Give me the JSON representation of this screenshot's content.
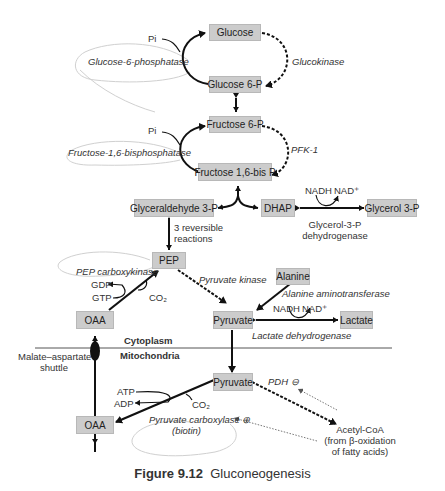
{
  "figure": {
    "caption_number": "Figure 9.12",
    "caption_title": "Gluconeogenesis"
  },
  "metabolites": {
    "glucose": "Glucose",
    "glucose6p": "Glucose 6-P",
    "fructose6p": "Fructose 6-P",
    "fructose16bp": "Fructose 1,6-bis P",
    "gap": "Glyceraldehyde 3-P",
    "dhap": "DHAP",
    "glycerol3p": "Glycerol 3-P",
    "pep": "PEP",
    "alanine": "Alanine",
    "pyruvate_cyto": "Pyruvate",
    "lactate": "Lactate",
    "oaa_cyto": "OAA",
    "pyruvate_mito": "Pyruvate",
    "oaa_mito": "OAA"
  },
  "enzymes": {
    "g6pase": "Glucose-6-phosphatase",
    "glucokinase": "Glucokinase",
    "f16bpase": "Fructose-1,6-bisphosphatase",
    "pfk1": "PFK-1",
    "g3pdh_line1": "Glycerol-3-P",
    "g3pdh_line2": "dehydrogenase",
    "pepck": "PEP carboxykinase",
    "pyruvate_kinase": "Pyruvate kinase",
    "alt": "Alanine aminotransferase",
    "ldh": "Lactate dehydrogenase",
    "pdh": "PDH ⊖",
    "pc_line1": "Pyruvate carboxylase ⊕",
    "pc_line2": "(biotin)"
  },
  "cofactors": {
    "pi_1": "Pi",
    "pi_2": "Pi",
    "nadh_1": "NADH",
    "nad_1": "NAD⁺",
    "nadh_2": "NADH",
    "nad_2": "NAD⁺",
    "gdp": "GDP",
    "gtp": "GTP",
    "co2_1": "CO₂",
    "atp": "ATP",
    "adp": "ADP",
    "co2_2": "CO₂"
  },
  "notes": {
    "reversible_line1": "3 reversible",
    "reversible_line2": "reactions",
    "cytoplasm": "Cytoplasm",
    "mitochondria": "Mitochondria",
    "shuttle_line1": "Malate–aspartate",
    "shuttle_line2": "shuttle",
    "acetylcoa_line1": "Acetyl-CoA",
    "acetylcoa_line2": "(from β-oxidation",
    "acetylcoa_line3": "of fatty acids)"
  },
  "colors": {
    "box_fill": "#cccccc",
    "box_border": "#b8b8b8",
    "arrow": "#111111",
    "loop_outline": "#cfcfcf"
  }
}
